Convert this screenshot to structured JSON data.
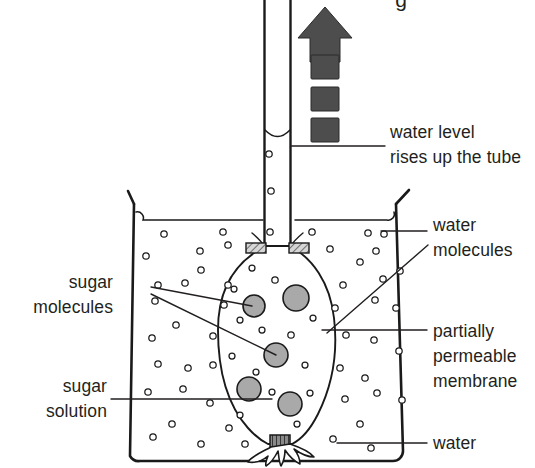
{
  "diagram": {
    "title_partial": "g",
    "colors": {
      "ink": "#231f20",
      "outline": "#1a1a1a",
      "sugar_molecule_fill": "#a9a9a9",
      "water_molecule_fill": "#ffffff",
      "arrow_fill": "#4d4d4d",
      "band_fill": "#c9c9c9",
      "background": "#ffffff"
    }
  },
  "labels": {
    "water_level": {
      "line1": "water level",
      "line2": "rises up the tube"
    },
    "water_molecules": {
      "line1": "water",
      "line2": "molecules"
    },
    "sugar_molecules": {
      "line1": "sugar",
      "line2": "molecules"
    },
    "partially_permeable_membrane": {
      "line1": "partially",
      "line2": "permeable",
      "line3": "membrane"
    },
    "sugar_solution": {
      "line1": "sugar",
      "line2": "solution"
    },
    "water": {
      "line1": "water"
    }
  },
  "arrow": {
    "name": "upward-flow-arrow",
    "direction": "up",
    "dash_count": 3
  },
  "chart_data": {
    "type": "diagram",
    "elements": [
      {
        "name": "capillary-tube",
        "count": 1
      },
      {
        "name": "beaker",
        "count": 1
      },
      {
        "name": "membrane-bag",
        "count": 1
      },
      {
        "name": "sugar-molecule",
        "count": 5
      },
      {
        "name": "water-molecule-outside",
        "count": 51
      },
      {
        "name": "water-molecule-inside",
        "count": 14
      },
      {
        "name": "upward-arrow-dash",
        "count": 3
      },
      {
        "name": "label",
        "count": 6
      }
    ]
  },
  "sugar_molecules": [
    {
      "cx": 254,
      "cy": 306,
      "r": 11
    },
    {
      "cx": 296,
      "cy": 298,
      "r": 13
    },
    {
      "cx": 276,
      "cy": 355,
      "r": 12
    },
    {
      "cx": 249,
      "cy": 389,
      "r": 12
    },
    {
      "cx": 290,
      "cy": 404,
      "r": 12
    }
  ],
  "water_molecules_inside": [
    {
      "cx": 252,
      "cy": 268,
      "r": 3.0
    },
    {
      "cx": 275,
      "cy": 280,
      "r": 3.2
    },
    {
      "cx": 234,
      "cy": 289,
      "r": 3.0
    },
    {
      "cx": 262,
      "cy": 330,
      "r": 3.0
    },
    {
      "cx": 291,
      "cy": 335,
      "r": 3.2
    },
    {
      "cx": 240,
      "cy": 320,
      "r": 3.0
    },
    {
      "cx": 313,
      "cy": 318,
      "r": 3.0
    },
    {
      "cx": 232,
      "cy": 356,
      "r": 3.0
    },
    {
      "cx": 305,
      "cy": 365,
      "r": 3.0
    },
    {
      "cx": 256,
      "cy": 372,
      "r": 3.0
    },
    {
      "cx": 272,
      "cy": 392,
      "r": 3.0
    },
    {
      "cx": 310,
      "cy": 393,
      "r": 3.0
    },
    {
      "cx": 240,
      "cy": 415,
      "r": 3.0
    },
    {
      "cx": 297,
      "cy": 424,
      "r": 3.0
    }
  ],
  "water_molecules_outside": [
    {
      "cx": 269,
      "cy": 154,
      "r": 3.2
    },
    {
      "cx": 271,
      "cy": 191,
      "r": 3.2
    },
    {
      "cx": 270,
      "cy": 232,
      "r": 3.2
    },
    {
      "cx": 164,
      "cy": 234,
      "r": 3.2
    },
    {
      "cx": 223,
      "cy": 232,
      "r": 3.2
    },
    {
      "cx": 312,
      "cy": 232,
      "r": 3.2
    },
    {
      "cx": 368,
      "cy": 233,
      "r": 3.2
    },
    {
      "cx": 384,
      "cy": 234,
      "r": 3.2
    },
    {
      "cx": 146,
      "cy": 256,
      "r": 3.2
    },
    {
      "cx": 200,
      "cy": 251,
      "r": 3.2
    },
    {
      "cx": 228,
      "cy": 245,
      "r": 3.2
    },
    {
      "cx": 330,
      "cy": 249,
      "r": 3.2
    },
    {
      "cx": 376,
      "cy": 251,
      "r": 3.2
    },
    {
      "cx": 158,
      "cy": 285,
      "r": 3.2
    },
    {
      "cx": 185,
      "cy": 283,
      "r": 3.2
    },
    {
      "cx": 201,
      "cy": 270,
      "r": 3.2
    },
    {
      "cx": 228,
      "cy": 285,
      "r": 3.2
    },
    {
      "cx": 343,
      "cy": 285,
      "r": 3.2
    },
    {
      "cx": 360,
      "cy": 262,
      "r": 3.2
    },
    {
      "cx": 383,
      "cy": 279,
      "r": 3.2
    },
    {
      "cx": 400,
      "cy": 271,
      "r": 3.2
    },
    {
      "cx": 155,
      "cy": 301,
      "r": 3.2
    },
    {
      "cx": 224,
      "cy": 305,
      "r": 3.2
    },
    {
      "cx": 335,
      "cy": 308,
      "r": 3.2
    },
    {
      "cx": 375,
      "cy": 300,
      "r": 3.2
    },
    {
      "cx": 396,
      "cy": 308,
      "r": 3.2
    },
    {
      "cx": 152,
      "cy": 338,
      "r": 3.2
    },
    {
      "cx": 176,
      "cy": 325,
      "r": 3.2
    },
    {
      "cx": 213,
      "cy": 336,
      "r": 3.2
    },
    {
      "cx": 346,
      "cy": 335,
      "r": 3.2
    },
    {
      "cx": 374,
      "cy": 340,
      "r": 3.2
    },
    {
      "cx": 399,
      "cy": 351,
      "r": 3.2
    },
    {
      "cx": 158,
      "cy": 364,
      "r": 3.2
    },
    {
      "cx": 188,
      "cy": 368,
      "r": 3.2
    },
    {
      "cx": 213,
      "cy": 365,
      "r": 3.2
    },
    {
      "cx": 340,
      "cy": 368,
      "r": 3.2
    },
    {
      "cx": 365,
      "cy": 378,
      "r": 3.2
    },
    {
      "cx": 148,
      "cy": 392,
      "r": 3.2
    },
    {
      "cx": 183,
      "cy": 389,
      "r": 3.2
    },
    {
      "cx": 210,
      "cy": 403,
      "r": 3.2
    },
    {
      "cx": 345,
      "cy": 399,
      "r": 3.2
    },
    {
      "cx": 377,
      "cy": 393,
      "r": 3.2
    },
    {
      "cx": 402,
      "cy": 400,
      "r": 3.2
    },
    {
      "cx": 153,
      "cy": 437,
      "r": 3.2
    },
    {
      "cx": 172,
      "cy": 424,
      "r": 3.2
    },
    {
      "cx": 201,
      "cy": 444,
      "r": 3.2
    },
    {
      "cx": 229,
      "cy": 428,
      "r": 3.2
    },
    {
      "cx": 245,
      "cy": 444,
      "r": 3.2
    },
    {
      "cx": 333,
      "cy": 439,
      "r": 3.2
    },
    {
      "cx": 360,
      "cy": 424,
      "r": 3.2
    },
    {
      "cx": 371,
      "cy": 448,
      "r": 3.2
    }
  ]
}
